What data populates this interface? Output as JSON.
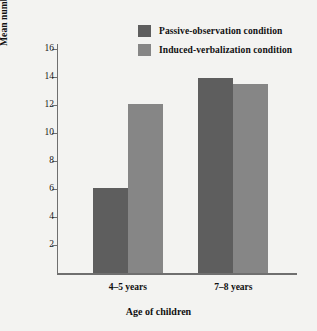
{
  "chart_data": {
    "type": "bar",
    "title": "",
    "xlabel": "Age of children",
    "ylabel": "Mean number of responses correctly reproduced",
    "categories": [
      "4–5 years",
      "7–8 years"
    ],
    "series": [
      {
        "name": "Passive-observation condition",
        "color": "#5e5e5e",
        "values": [
          6.1,
          13.9
        ]
      },
      {
        "name": "Induced-verbalization condition",
        "color": "#868686",
        "values": [
          12.1,
          13.5
        ]
      }
    ],
    "ylim": [
      0,
      16
    ],
    "yticks": [
      2,
      4,
      6,
      8,
      10,
      12,
      14,
      16
    ],
    "ytick_labels": [
      "2",
      "4",
      "6",
      "8",
      "10",
      "12",
      "14",
      "16"
    ],
    "grid": false,
    "legend_position": "top-center",
    "background_color": "#f3f3f1",
    "axis_color": "#6f6f6f"
  }
}
